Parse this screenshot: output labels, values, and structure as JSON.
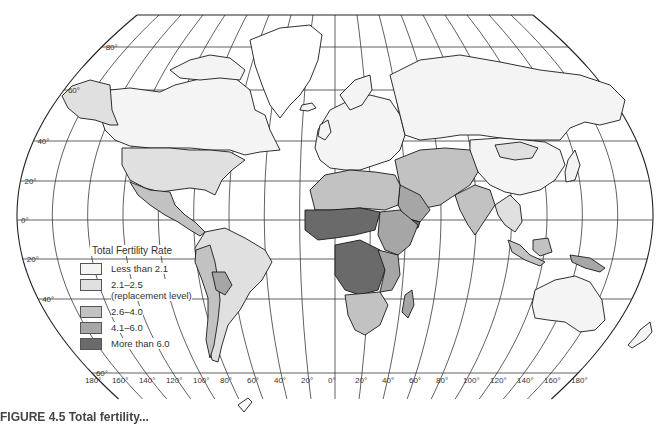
{
  "map": {
    "title": "Total Fertility Rate",
    "latitude_labels": [
      "80°",
      "60°",
      "40°",
      "20°",
      "0°",
      "20°",
      "40°",
      "60°"
    ],
    "longitude_labels": [
      "180°",
      "160°",
      "140°",
      "120°",
      "100°",
      "80°",
      "60°",
      "40°",
      "20°",
      "0°",
      "20°",
      "40°",
      "60°",
      "80°",
      "100°",
      "120°",
      "140°",
      "160°",
      "180°"
    ],
    "colors": {
      "less_than_2_1": "#f4f4f4",
      "2_1_to_2_5": "#e0e0e0",
      "2_6_to_4_0": "#c2c2c2",
      "4_1_to_6_0": "#a6a6a6",
      "more_than_6_0": "#6a6a6a"
    }
  },
  "legend": {
    "title": "Total Fertility Rate",
    "items": [
      {
        "label": "Less than 2.1",
        "sublabel": "",
        "color": "#f4f4f4"
      },
      {
        "label": "2.1–2.5",
        "sublabel": "(replacement level)",
        "color": "#e0e0e0"
      },
      {
        "label": "2.6–4.0",
        "sublabel": "",
        "color": "#c2c2c2"
      },
      {
        "label": "4.1–6.0",
        "sublabel": "",
        "color": "#a6a6a6"
      },
      {
        "label": "More than 6.0",
        "sublabel": "",
        "color": "#6a6a6a"
      }
    ]
  },
  "caption": "FIGURE 4.5  Total fertility..."
}
